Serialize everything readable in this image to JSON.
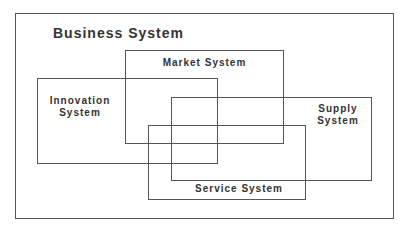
{
  "diagram": {
    "title": "Business System",
    "boxes": {
      "market": {
        "label": "Market System"
      },
      "innovation": {
        "label_line1": "Innovation",
        "label_line2": "System"
      },
      "supply": {
        "label_line1": "Supply",
        "label_line2": "System"
      },
      "service": {
        "label": "Service System"
      }
    },
    "colors": {
      "line": "#555555",
      "text": "#333333",
      "background": "#ffffff"
    }
  }
}
